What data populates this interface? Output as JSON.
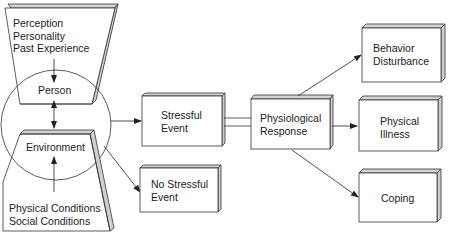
{
  "diagram": {
    "person_factors": [
      "Perception",
      "Personality",
      "Past Experience"
    ],
    "person": "Person",
    "environment": "Environment",
    "environment_factors": [
      "Physical Conditions",
      "Social Conditions"
    ],
    "stressful_event": [
      "Stressful",
      "Event"
    ],
    "no_stressful_event": [
      "No Stressful",
      "Event"
    ],
    "physiological_response": [
      "Physiological",
      "Response"
    ],
    "behavior_disturbance": [
      "Behavior",
      "Disturbance"
    ],
    "physical_illness": [
      "Physical",
      "Illness"
    ],
    "coping": "Coping"
  },
  "colors": {
    "line": "#333333",
    "shade": "#cfcfcf",
    "text": "#222222"
  }
}
